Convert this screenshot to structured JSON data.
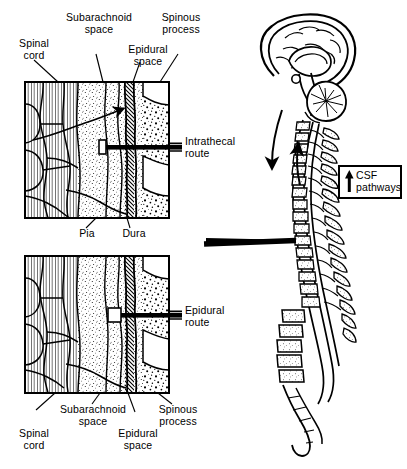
{
  "figure": {
    "type": "anatomical-illustration",
    "style": "black-and-white line drawing with stipple and hatch shading",
    "background_color": "#ffffff",
    "ink_color": "#000000"
  },
  "panels": {
    "upper": {
      "name": "Intrathecal route cross-section",
      "route_label": "Intrathecal\nroute",
      "needle": "needle passes through epidural space and dura into the subarachnoid space",
      "labels_above": [
        {
          "id": "spinal-cord",
          "text": "Spinal\ncord"
        },
        {
          "id": "subarachnoid-space",
          "text": "Subarachnoid\nspace"
        },
        {
          "id": "epidural-space",
          "text": "Epidural\nspace"
        },
        {
          "id": "spinous-process",
          "text": "Spinous\nprocess"
        }
      ]
    },
    "middle_labels": [
      {
        "id": "pia",
        "text": "Pia"
      },
      {
        "id": "dura",
        "text": "Dura"
      }
    ],
    "lower": {
      "name": "Epidural route cross-section",
      "route_label": "Epidural\nroute",
      "needle": "needle stops short within the epidural space, outside the dura",
      "labels_below": [
        {
          "id": "spinal-cord",
          "text": "Spinal\ncord"
        },
        {
          "id": "subarachnoid-space",
          "text": "Subarachnoid\nspace"
        },
        {
          "id": "epidural-space",
          "text": "Epidural\nspace"
        },
        {
          "id": "spinous-process",
          "text": "Spinous\nprocess"
        }
      ]
    }
  },
  "spine_diagram": {
    "name": "Midsagittal brain and vertebral column",
    "parts": [
      "cerebrum",
      "corpus callosum",
      "cerebellum",
      "brainstem",
      "cervical vertebrae",
      "thoracic vertebrae",
      "lumbar vertebrae",
      "sacrum",
      "coccyx",
      "spinal cord",
      "dural sac"
    ],
    "flow_arrows": [
      "descending CSF flow arrow",
      "ascending CSF flow arrow"
    ],
    "pointer_arrow": "bold arrow from lumbar spine to the cross-section panels"
  },
  "legend": {
    "name": "CSF pathways legend",
    "arrow_icon": "up-arrow-icon",
    "text": "CSF\npathways"
  }
}
